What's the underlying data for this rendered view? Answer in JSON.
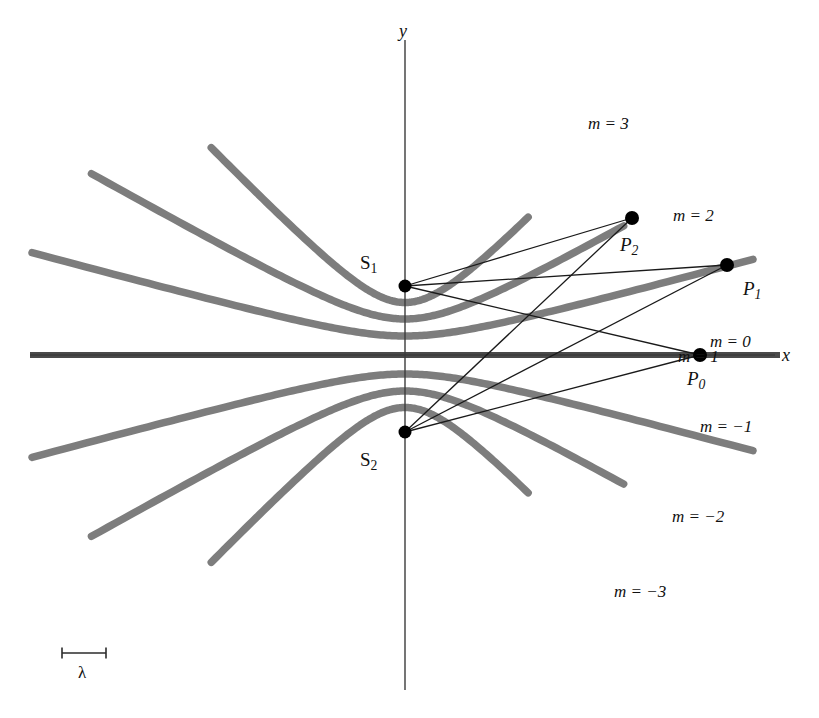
{
  "figure": {
    "kind": "interference-hyperbolas",
    "background_color": "#ffffff",
    "curve_color": "#7d7d7d",
    "axis_color": "#3b3b3b",
    "ray_color": "#1a1a1a",
    "dot_color": "#000000"
  },
  "axes": {
    "x_label": "x",
    "y_label": "y",
    "origin": {
      "x": 405,
      "y": 355
    }
  },
  "sources": [
    {
      "id": "S1",
      "label": "S",
      "subscript": "1",
      "x": 405,
      "y": 286
    },
    {
      "id": "S2",
      "label": "S",
      "subscript": "2",
      "x": 405,
      "y": 432
    }
  ],
  "points": [
    {
      "id": "P0",
      "label": "P",
      "subscript": "0",
      "x": 700,
      "y": 355
    },
    {
      "id": "P1",
      "label": "P",
      "subscript": "1",
      "x": 727,
      "y": 265
    },
    {
      "id": "P2",
      "label": "P",
      "subscript": "2",
      "x": 632,
      "y": 218
    }
  ],
  "rays": [
    {
      "from": "S1",
      "to": "P0"
    },
    {
      "from": "S1",
      "to": "P1"
    },
    {
      "from": "S1",
      "to": "P2"
    },
    {
      "from": "S2",
      "to": "P0"
    },
    {
      "from": "S2",
      "to": "P1"
    },
    {
      "from": "S2",
      "to": "P2"
    }
  ],
  "fringe_labels": [
    {
      "m": 3,
      "text": "m = 3",
      "x": 588,
      "y": 115
    },
    {
      "m": 2,
      "text": "m = 2",
      "x": 673,
      "y": 207
    },
    {
      "m": 1,
      "text": "m = 1",
      "x": 678,
      "y": 348
    },
    {
      "m": 0,
      "text": "m = 0",
      "x": 710,
      "y": 333
    },
    {
      "m": -1,
      "text": "m = -1",
      "x": 700,
      "y": 418
    },
    {
      "m": -2,
      "text": "m = -2",
      "x": 672,
      "y": 508
    },
    {
      "m": -3,
      "text": "m = -3",
      "x": 614,
      "y": 583
    }
  ],
  "scale_bar": {
    "label": "λ",
    "x_start": 62,
    "x_end": 106,
    "y": 653,
    "tick_height": 11,
    "label_x": 78,
    "label_y": 664
  },
  "chart_data": {
    "type": "line",
    "title": "",
    "xlabel": "x",
    "ylabel": "y",
    "source_separation_px": 146,
    "origin_px": [
      405,
      355
    ],
    "xlim_px": [
      30,
      780
    ],
    "ylim_px": [
      60,
      640
    ],
    "grid": false,
    "legend": "none",
    "series": [
      {
        "name": "m = 3",
        "a": 52.5,
        "c": 73,
        "branch": "upper",
        "t_range": [
          -2.05,
          1.62
        ]
      },
      {
        "name": "m = 2",
        "a": 36.0,
        "c": 73,
        "branch": "upper",
        "t_range": [
          -2.3,
          1.95
        ]
      },
      {
        "name": "m = 1",
        "a": 19.0,
        "c": 73,
        "branch": "upper",
        "t_range": [
          -2.55,
          2.3
        ]
      },
      {
        "name": "m = 0",
        "a": 0.0,
        "c": 73,
        "branch": "axis",
        "t_range": [
          0,
          0
        ]
      },
      {
        "name": "m = -1",
        "a": 19.0,
        "c": 73,
        "branch": "lower",
        "t_range": [
          -2.55,
          2.3
        ]
      },
      {
        "name": "m = -2",
        "a": 36.0,
        "c": 73,
        "branch": "lower",
        "t_range": [
          -2.3,
          1.95
        ]
      },
      {
        "name": "m = -3",
        "a": 52.5,
        "c": 73,
        "branch": "lower",
        "t_range": [
          -2.05,
          1.62
        ]
      }
    ]
  }
}
